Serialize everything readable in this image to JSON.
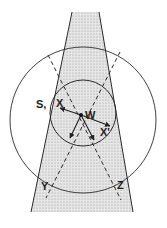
{
  "diagram": {
    "labels": {
      "S": "S,",
      "X": "X",
      "W": "W",
      "Xprime": "X'",
      "Y": "Y",
      "Z": "Z"
    },
    "colors": {
      "stroke": "#2a2a2a",
      "beam_fill": "#d9d9d9",
      "background": "#ffffff"
    },
    "shapes": {
      "beam": "shaded trapezoid narrowing upward",
      "outer_circle": "large circle",
      "inner_circle": "small circle",
      "dashed_lines": [
        "W to Y (dashed)",
        "W to Z (dashed)"
      ],
      "arrows": [
        "W to X",
        "W to X'",
        "W to lower-left",
        "W to lower-right"
      ]
    }
  }
}
